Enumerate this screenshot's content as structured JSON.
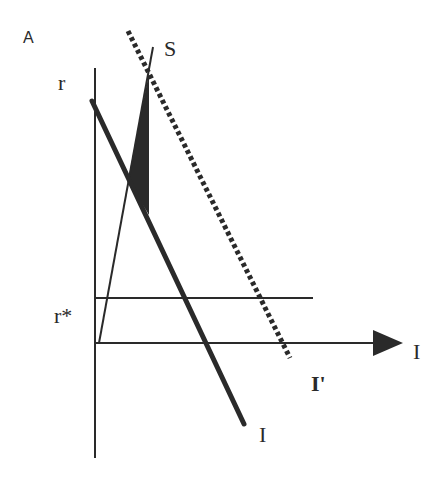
{
  "diagram": {
    "panel_label": "A",
    "y_axis_label": "r",
    "x_axis_label": "I",
    "r_star_label": "r*",
    "curves": {
      "saving": {
        "label": "S"
      },
      "investment": {
        "label": "I"
      },
      "investment_shifted": {
        "label": "I'",
        "style": "dotted"
      }
    },
    "colors": {
      "line": "#2a2a2a",
      "background": "#ffffff"
    }
  }
}
